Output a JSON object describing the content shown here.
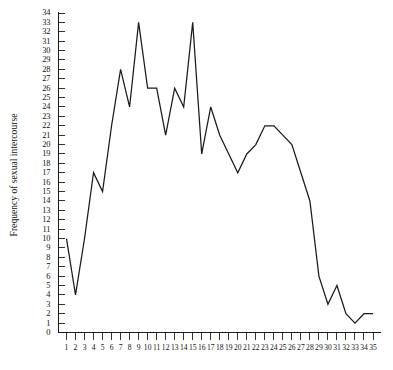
{
  "chart_data": {
    "type": "line",
    "title": "",
    "subtitle": "",
    "xlabel": "",
    "ylabel": "Frequency of sexual intercourse",
    "x": [
      1,
      2,
      3,
      4,
      5,
      6,
      7,
      8,
      9,
      10,
      11,
      12,
      13,
      14,
      15,
      16,
      17,
      18,
      19,
      20,
      21,
      22,
      23,
      24,
      25,
      26,
      27,
      28,
      29,
      30,
      31,
      32,
      33,
      34,
      35
    ],
    "values": [
      10,
      4,
      10,
      17,
      15,
      22,
      28,
      24,
      33,
      26,
      26,
      21,
      26,
      24,
      33,
      19,
      24,
      21,
      19,
      17,
      19,
      20,
      22,
      22,
      21,
      20,
      17,
      14,
      6,
      3,
      5,
      2,
      1,
      2,
      2
    ],
    "series": [
      {
        "name": "Frequency of sexual intercourse",
        "values": [
          10,
          4,
          10,
          17,
          15,
          22,
          28,
          24,
          33,
          26,
          26,
          21,
          26,
          24,
          33,
          19,
          24,
          21,
          19,
          17,
          19,
          20,
          22,
          22,
          21,
          20,
          17,
          14,
          6,
          3,
          5,
          2,
          1,
          2,
          2
        ]
      }
    ],
    "xtick_labels": [
      "1",
      "2",
      "3",
      "4",
      "5",
      "6",
      "7",
      "8",
      "9",
      "10",
      "11",
      "12",
      "13",
      "14",
      "15",
      "16",
      "17",
      "18",
      "19",
      "20",
      "21",
      "22",
      "23",
      "24",
      "25",
      "26",
      "27",
      "28",
      "29",
      "30",
      "31",
      "32",
      "33",
      "34",
      "35"
    ],
    "ytick_labels": [
      "0",
      "1",
      "2",
      "3",
      "4",
      "5",
      "6",
      "7",
      "8",
      "9",
      "10",
      "11",
      "12",
      "13",
      "14",
      "15",
      "16",
      "17",
      "18",
      "19",
      "20",
      "21",
      "22",
      "23",
      "24",
      "25",
      "26",
      "27",
      "28",
      "29",
      "30",
      "31",
      "32",
      "33",
      "34"
    ],
    "xlim": [
      1,
      35
    ],
    "ylim": [
      0,
      34
    ],
    "grid": false,
    "legend": false,
    "legend_position": "none",
    "line_color": "#1a1a1a",
    "background_color": "#ffffff"
  },
  "axes": {
    "y_axis_title": "Frequency of sexual intercourse"
  }
}
